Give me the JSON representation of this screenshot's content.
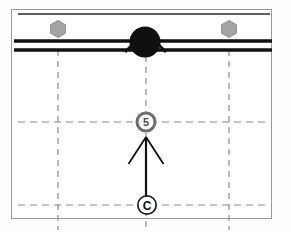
{
  "figure": {
    "domain_type": "engineering-detail-drawing",
    "canvas": {
      "width": 291,
      "height": 232,
      "background": "#fefefe"
    },
    "frame": {
      "name": "drawing-frame",
      "x": 11,
      "y": 9,
      "width": 261,
      "height": 210,
      "stroke": "#9a9a9a",
      "stroke_width": 1,
      "fill": "#ffffff"
    },
    "colors": {
      "line_black": "#111111",
      "line_gray": "#7a7a7a",
      "hexagon_fill": "#a4a4a4",
      "hexagon_stroke": "#8d8d8d",
      "node_fill": "#101010",
      "dash_gray": "#8c8c8c",
      "callout_ring_gray": "#6f6f6f",
      "callout_ring_black": "#1a1a1a",
      "frame_stroke": "#9a9a9a",
      "artifact": "#e9e9e9"
    },
    "solid_rails": [
      {
        "name": "rail-top",
        "y": 14,
        "x1": 18,
        "x2": 270,
        "stroke": "#5f5f5f",
        "stroke_width": 2
      },
      {
        "name": "rail-middle",
        "y": 41,
        "x1": 14,
        "x2": 272,
        "stroke": "#111111",
        "stroke_width": 3
      },
      {
        "name": "rail-bottom",
        "y": 50,
        "x1": 14,
        "x2": 272,
        "stroke": "#111111",
        "stroke_width": 3
      }
    ],
    "node": {
      "name": "connection-node",
      "cx": 145,
      "cy": 42,
      "r": 15,
      "fill": "#101010",
      "gusset_left": {
        "x1": 126,
        "y1": 51,
        "x2": 140,
        "y2": 38
      },
      "gusset_right": {
        "x1": 164,
        "y1": 51,
        "x2": 150,
        "y2": 38
      }
    },
    "hexagons": [
      {
        "name": "hex-bolt-left",
        "cx": 58,
        "cy": 29,
        "r": 8.5,
        "label": ""
      },
      {
        "name": "hex-bolt-right",
        "cx": 229,
        "cy": 29,
        "r": 8.5,
        "label": ""
      }
    ],
    "dashed_vertical_axes": [
      {
        "name": "axis-left",
        "x": 58,
        "y1": 50,
        "y2": 228
      },
      {
        "name": "axis-center",
        "x": 146,
        "y1": 55,
        "y2": 228
      },
      {
        "name": "axis-right",
        "x": 229,
        "y1": 50,
        "y2": 228
      }
    ],
    "dashed_horizontal_axes": [
      {
        "name": "axis-upper-horizontal",
        "y": 122,
        "x1": 18,
        "x2": 268
      },
      {
        "name": "axis-lower-horizontal",
        "y": 205,
        "x1": 18,
        "x2": 268
      }
    ],
    "arrow": {
      "name": "section-arrow",
      "x": 146,
      "tail_y": 196,
      "head_y": 137,
      "head_left": {
        "x1": 146,
        "y1": 137,
        "x2": 128,
        "y2": 164
      },
      "head_right": {
        "x1": 146,
        "y1": 137,
        "x2": 164,
        "y2": 164
      },
      "stroke": "#111111",
      "stroke_width": 2
    },
    "callouts": [
      {
        "name": "callout-detail-5",
        "label": "5",
        "cx": 146,
        "cy": 122,
        "r": 9.5,
        "ring_color": "#6f6f6f",
        "ring_width": 3,
        "fill": "#ffffff",
        "text_color": "#4a4a4a",
        "font_size": 11
      },
      {
        "name": "callout-section-c",
        "label": "C",
        "cx": 147,
        "cy": 205,
        "r": 9.5,
        "ring_color": "#1a1a1a",
        "ring_width": 1.6,
        "fill": "#ffffff",
        "text_color": "#111111",
        "font_size": 12
      }
    ],
    "artifacts": {
      "bottom_left_text": ""
    }
  }
}
